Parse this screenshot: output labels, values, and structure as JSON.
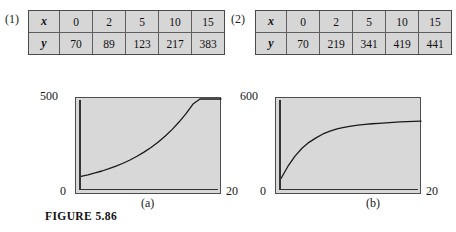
{
  "figure": {
    "caption": "FIGURE 5.86",
    "subcaption_a": "(a)",
    "subcaption_b": "(b)"
  },
  "panels": [
    {
      "index_label": "(1)"
    },
    {
      "index_label": "(2)"
    }
  ],
  "tables": [
    {
      "id": "table-1",
      "row_headers": [
        "x",
        "y"
      ],
      "x_values": [
        "0",
        "2",
        "5",
        "10",
        "15"
      ],
      "y_values": [
        "70",
        "89",
        "123",
        "217",
        "383"
      ]
    },
    {
      "id": "table-2",
      "row_headers": [
        "x",
        "y"
      ],
      "x_values": [
        "0",
        "2",
        "5",
        "10",
        "15"
      ],
      "y_values": [
        "70",
        "219",
        "341",
        "419",
        "441"
      ]
    }
  ],
  "axis_labels": {
    "a": {
      "y_max": "500",
      "y_min": "0",
      "x_max": "20"
    },
    "b": {
      "y_max": "600",
      "y_min": "0",
      "x_max": "20"
    }
  },
  "colors": {
    "plot_fill": "#d8d8d8",
    "table_fill": "#d6d6d6",
    "frame": "#4d4d4d",
    "curve": "#1a1a1a",
    "page": "#ffffff"
  },
  "chart_data": [
    {
      "type": "line",
      "title": "(a)",
      "xlabel": "",
      "ylabel": "",
      "xlim": [
        0,
        20
      ],
      "ylim": [
        0,
        500
      ],
      "grid": false,
      "legend": "none",
      "description": "Exponential growth curve through the data of table (1)",
      "x": [
        0,
        2,
        5,
        10,
        15
      ],
      "y": [
        70,
        89,
        123,
        217,
        383
      ],
      "curve_x": [
        0,
        1,
        2,
        3,
        4,
        5,
        6,
        7,
        8,
        9,
        10,
        11,
        12,
        13,
        14,
        15,
        16,
        17,
        18,
        19,
        20
      ],
      "curve_y": [
        70,
        79,
        89,
        100,
        113,
        127,
        143,
        161,
        182,
        205,
        231,
        260,
        293,
        330,
        372,
        419,
        472,
        500,
        500,
        500,
        500
      ]
    },
    {
      "type": "line",
      "title": "(b)",
      "xlabel": "",
      "ylabel": "",
      "xlim": [
        0,
        20
      ],
      "ylim": [
        0,
        600
      ],
      "grid": false,
      "legend": "none",
      "description": "Saturating (bounded) growth curve through the data of table (2)",
      "x": [
        0,
        2,
        5,
        10,
        15
      ],
      "y": [
        70,
        219,
        341,
        419,
        441
      ],
      "curve_x": [
        0,
        1,
        2,
        3,
        4,
        5,
        6,
        7,
        8,
        9,
        10,
        11,
        12,
        13,
        14,
        15,
        16,
        17,
        18,
        19,
        20
      ],
      "curve_y": [
        70,
        152,
        219,
        272,
        311,
        341,
        367,
        386,
        401,
        411,
        419,
        426,
        431,
        435,
        438,
        441,
        444,
        447,
        449,
        451,
        453
      ]
    }
  ]
}
